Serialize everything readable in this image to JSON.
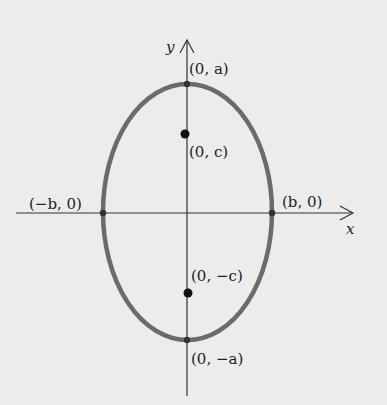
{
  "diagram": {
    "axes": {
      "x_label": "x",
      "y_label": "y"
    },
    "ellipse": {
      "center": [
        0,
        0
      ],
      "semi_major_axis": "a",
      "semi_minor_axis": "b",
      "orientation": "vertical",
      "stroke_color": "#6b6b6b"
    },
    "labels": {
      "top_vertex": "(0, a)",
      "bottom_vertex": "(0, −a)",
      "left_vertex": "(−b, 0)",
      "right_vertex": "(b, 0)",
      "focus_top": "(0, c)",
      "focus_bottom": "(0, −c)"
    },
    "colors": {
      "background": "#ececec",
      "axis": "#333333",
      "ellipse": "#6b6b6b",
      "focus_dot": "#111111",
      "text": "#222222"
    }
  }
}
